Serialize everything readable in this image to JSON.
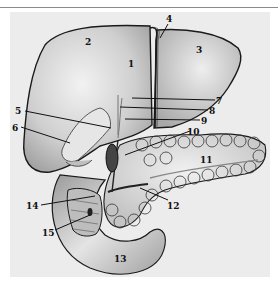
{
  "figure": {
    "colors": {
      "background": "#ffffff",
      "panel": "#ececec",
      "rule": "#8a8a8a",
      "organ_fill": "#d6d6d6",
      "organ_light": "#e8e8e8",
      "organ_dark": "#9a9a9a",
      "outline": "#1a1a1a"
    },
    "labels": [
      {
        "id": "1",
        "text": "1",
        "x": 131,
        "y": 64,
        "anchor": "in"
      },
      {
        "id": "2",
        "text": "2",
        "x": 88,
        "y": 42,
        "anchor": "in"
      },
      {
        "id": "3",
        "text": "3",
        "x": 199,
        "y": 50,
        "anchor": "in"
      },
      {
        "id": "4",
        "text": "4",
        "x": 169,
        "y": 21,
        "anchor": "out",
        "line": [
          [
            168,
            24
          ],
          [
            160,
            38
          ]
        ]
      },
      {
        "id": "5",
        "text": "5",
        "x": 17,
        "y": 112,
        "anchor": "out",
        "line": [
          [
            25,
            111
          ],
          [
            111,
            128
          ]
        ]
      },
      {
        "id": "6",
        "text": "6",
        "x": 14,
        "y": 128,
        "anchor": "out",
        "line": [
          [
            21,
            127
          ],
          [
            70,
            143
          ]
        ]
      },
      {
        "id": "7",
        "text": "7",
        "x": 217,
        "y": 103,
        "anchor": "out",
        "line": [
          [
            132,
            98
          ],
          [
            215,
            100
          ]
        ]
      },
      {
        "id": "8",
        "text": "8",
        "x": 210,
        "y": 113,
        "anchor": "out",
        "line": [
          [
            120,
            107
          ],
          [
            208,
            110
          ]
        ]
      },
      {
        "id": "9",
        "text": "9",
        "x": 202,
        "y": 123,
        "anchor": "out",
        "line": [
          [
            125,
            119
          ],
          [
            200,
            120
          ]
        ]
      },
      {
        "id": "10",
        "text": "10",
        "x": 192,
        "y": 135,
        "anchor": "out",
        "line": [
          [
            190,
            131
          ],
          [
            125,
            155
          ]
        ]
      },
      {
        "id": "11",
        "text": "11",
        "x": 204,
        "y": 163,
        "anchor": "in"
      },
      {
        "id": "12",
        "text": "12",
        "x": 170,
        "y": 206,
        "anchor": "out",
        "line": [
          [
            168,
            200
          ],
          [
            140,
            188
          ]
        ]
      },
      {
        "id": "13",
        "text": "13",
        "x": 119,
        "y": 260,
        "anchor": "in"
      },
      {
        "id": "14",
        "text": "14",
        "x": 27,
        "y": 208,
        "anchor": "out",
        "line": [
          [
            41,
            205
          ],
          [
            95,
            196
          ]
        ]
      },
      {
        "id": "15",
        "text": "15",
        "x": 43,
        "y": 233,
        "anchor": "out",
        "line": [
          [
            55,
            230
          ],
          [
            90,
            215
          ]
        ]
      }
    ]
  }
}
